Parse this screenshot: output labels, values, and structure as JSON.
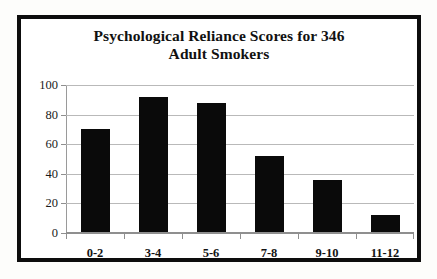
{
  "figure": {
    "title_line1": "Psychological Reliance Scores for 346",
    "title_line2": "Adult Smokers",
    "frame_color": "#0d0d0d",
    "background_color": "#ffffff",
    "page_background_color": "#fdfdfb"
  },
  "chart_data": {
    "type": "bar",
    "categories": [
      "0-2",
      "3-4",
      "5-6",
      "7-8",
      "9-10",
      "11-12"
    ],
    "values": [
      70,
      92,
      88,
      52,
      36,
      12
    ],
    "xlabel": "",
    "ylabel": "",
    "ylim": [
      0,
      100
    ],
    "yticks": [
      0,
      20,
      40,
      60,
      80,
      100
    ],
    "ytick_labels": [
      "0",
      "20",
      "40",
      "60",
      "80",
      "100"
    ],
    "grid": true,
    "grid_axis": "y",
    "legend": false,
    "bar_color": "#0a0a0a",
    "gridline_color": "#b9b9b9"
  }
}
